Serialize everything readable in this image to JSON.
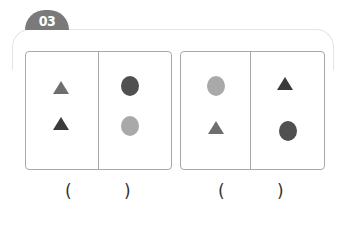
{
  "badge": {
    "label": "03",
    "color": "#7a7a7a"
  },
  "colors": {
    "dark": "#3a3a3a",
    "medium": "#6e6e6e",
    "medium_dark": "#505050",
    "light": "#a9a9a9"
  },
  "boxes": [
    {
      "left_cell": [
        {
          "shape": "triangle",
          "tone": "medium"
        },
        {
          "shape": "triangle",
          "tone": "dark"
        }
      ],
      "right_cell": [
        {
          "shape": "circle",
          "tone": "medium_dark"
        },
        {
          "shape": "circle",
          "tone": "light"
        }
      ],
      "answer": {
        "open": "(",
        "close": ")"
      }
    },
    {
      "left_cell": [
        {
          "shape": "circle",
          "tone": "light"
        },
        {
          "shape": "triangle",
          "tone": "medium"
        }
      ],
      "right_cell": [
        {
          "shape": "triangle",
          "tone": "dark"
        },
        {
          "shape": "circle",
          "tone": "medium_dark"
        }
      ],
      "answer": {
        "open": "(",
        "close": ")"
      }
    }
  ]
}
